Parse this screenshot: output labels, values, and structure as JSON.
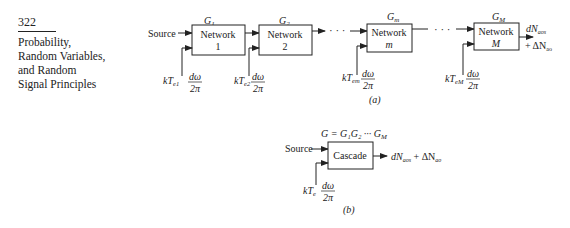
{
  "page": {
    "number": "322",
    "running_head": [
      "Probability,",
      "Random Variables,",
      "and Random",
      "Signal Principles"
    ]
  },
  "diagram_a": {
    "label": "(a)",
    "source_label": "Source",
    "networks": [
      {
        "gain": "G",
        "gain_sub": "1",
        "line1": "Network",
        "line2": "1",
        "noise_k": "kT",
        "noise_sub": "e1"
      },
      {
        "gain": "G",
        "gain_sub": "2",
        "line1": "Network",
        "line2": "2",
        "noise_k": "kT",
        "noise_sub": "e2"
      },
      {
        "gain": "G",
        "gain_sub": "m",
        "line1": "Network",
        "line2": "m",
        "noise_k": "kT",
        "noise_sub": "em"
      },
      {
        "gain": "G",
        "gain_sub": "M",
        "line1": "Network",
        "line2": "M",
        "noise_k": "kT",
        "noise_sub": "eM"
      }
    ],
    "ellipsis": "· · ·",
    "frac_num": "dω",
    "frac_den": "2π",
    "output_line1": "dN",
    "output_line1_sub": "aos",
    "output_line2": "+ ΔN",
    "output_line2_sub": "ao"
  },
  "diagram_b": {
    "label": "(b)",
    "gain_expr": "G = G₁G₂ ··· G",
    "gain_expr_sub": "M",
    "source_label": "Source",
    "block_label": "Cascade",
    "noise_k": "kT",
    "noise_sub": "e",
    "frac_num": "dω",
    "frac_den": "2π",
    "output": "dN",
    "output_sub": "aos",
    "output_plus": " + ΔN",
    "output_sub2": "ao"
  }
}
